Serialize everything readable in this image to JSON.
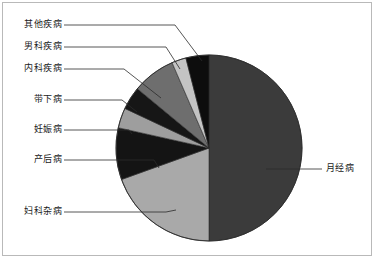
{
  "chart_data": {
    "type": "pie",
    "title": "",
    "subtitle": "",
    "xlabel": "",
    "ylabel": "",
    "legend_position": "none",
    "grid": false,
    "labels_position": "outside-with-leader-lines",
    "categories": [
      "月经病",
      "妇科杂病",
      "产后病",
      "妊娠病",
      "带下病",
      "内科疾病",
      "男科疾病",
      "其他疾病"
    ],
    "values": [
      50.0,
      19.5,
      9.0,
      3.5,
      4.0,
      7.5,
      2.5,
      4.0
    ],
    "value_unit": "%",
    "slice_colors": [
      "#3b3b3b",
      "#a9a9a9",
      "#141414",
      "#9e9e9e",
      "#161616",
      "#6e6e6e",
      "#c4c4c4",
      "#0d0d0d"
    ],
    "slice_order": "clockwise-from-12-oclock",
    "slices": [
      {
        "name": "月经病",
        "value": 50.0,
        "color": "#3b3b3b",
        "start_angle": 0,
        "end_angle": 180
      },
      {
        "name": "妇科杂病",
        "value": 19.5,
        "color": "#a9a9a9",
        "start_angle": 180,
        "end_angle": 250.2
      },
      {
        "name": "产后病",
        "value": 9.0,
        "color": "#141414",
        "start_angle": 250.2,
        "end_angle": 282.6
      },
      {
        "name": "妊娠病",
        "value": 3.5,
        "color": "#9e9e9e",
        "start_angle": 282.6,
        "end_angle": 295.2
      },
      {
        "name": "带下病",
        "value": 4.0,
        "color": "#161616",
        "start_angle": 295.2,
        "end_angle": 309.6
      },
      {
        "name": "内科疾病",
        "value": 7.5,
        "color": "#6e6e6e",
        "start_angle": 309.6,
        "end_angle": 336.6
      },
      {
        "name": "男科疾病",
        "value": 2.5,
        "color": "#c4c4c4",
        "start_angle": 336.6,
        "end_angle": 345.6
      },
      {
        "name": "其他疾病",
        "value": 4.0,
        "color": "#0d0d0d",
        "start_angle": 345.6,
        "end_angle": 360
      }
    ]
  },
  "labels": {
    "other_diseases": "其他疾病",
    "andrology_diseases": "男科疾病",
    "internal_medicine_diseases": "内科疾病",
    "leukorrhea_disease": "带下病",
    "pregnancy_disease": "妊娠病",
    "postpartum_disease": "产后病",
    "gynecological_misc_diseases": "妇科杂病",
    "menstrual_disease": "月经病"
  },
  "style": {
    "border_color": "#b9b9b9",
    "leader_line_color": "#2b2b2b",
    "pie_outline_color": "#2b2b2b",
    "background_color": "#ffffff",
    "text_color": "#1a1a1a"
  },
  "geometry": {
    "center_x": 209,
    "center_y": 148,
    "radius": 93
  }
}
